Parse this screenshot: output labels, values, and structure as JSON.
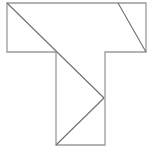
{
  "figure": {
    "background_color": "#ffffff",
    "outline_color": "#9a9a9a",
    "cut_color": "#6e6e6e",
    "outline_width": 1.3,
    "cut_width": 1.1,
    "fill_color": "#ffffff",
    "canvas": {
      "width": 155,
      "height": 156
    },
    "outline_points": "7,3 146,3 146,52 105,52 105,145 56,145 56,52 7,52",
    "vertices": {
      "top_left": {
        "x": 7,
        "y": 3,
        "label": "A"
      },
      "top_right": {
        "x": 146,
        "y": 3,
        "label": "B"
      },
      "bar_right_bottom": {
        "x": 146,
        "y": 52,
        "label": "C"
      },
      "stem_right_top": {
        "x": 105,
        "y": 52,
        "label": "D"
      },
      "stem_right_bottom": {
        "x": 105,
        "y": 145,
        "label": "E"
      },
      "stem_left_bottom": {
        "x": 56,
        "y": 145,
        "label": "F"
      },
      "stem_left_top": {
        "x": 56,
        "y": 52,
        "label": "G"
      },
      "bar_left_bottom": {
        "x": 7,
        "y": 52,
        "label": "H"
      },
      "mid_notch": {
        "x": 104,
        "y": 98,
        "label": "M"
      },
      "bar_top_cut": {
        "x": 118,
        "y": 3,
        "label": "N"
      }
    },
    "cuts": [
      {
        "name": "main-long-diagonal",
        "x1": 7,
        "y1": 3,
        "x2": 104,
        "y2": 98,
        "description": "long 45-degree diagonal from top-left corner through inner corner to stem mid-right"
      },
      {
        "name": "top-right-diagonal",
        "x1": 118,
        "y1": 3,
        "x2": 146,
        "y2": 52,
        "description": "short diagonal in top bar from top edge to bottom-right corner"
      },
      {
        "name": "lower-diagonal",
        "x1": 56,
        "y1": 145,
        "x2": 104,
        "y2": 98,
        "description": "diagonal from bottom-left of stem up to stem mid-right notch"
      }
    ]
  }
}
